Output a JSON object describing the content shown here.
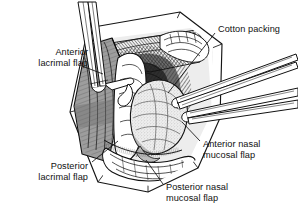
{
  "figure": {
    "type": "medical-line-illustration",
    "style": "black-and-white pen-and-ink hatching with gray tones",
    "background_color": "#ffffff",
    "ink_color": "#111111",
    "flap_gray": "#9a9a9a",
    "shadow_gray": "#4a4a4a",
    "packing_tone": "#e3e3e3"
  },
  "labels": [
    {
      "id": "anterior-lacrimal-flap",
      "lines": [
        "Anterior",
        "lacrimal flap"
      ],
      "align": "right",
      "leader_from": [
        82,
        66
      ],
      "leader_to": [
        103,
        74
      ]
    },
    {
      "id": "posterior-lacrimal-flap",
      "lines": [
        "Posterior",
        "lacrimal flap"
      ],
      "align": "right",
      "leader_from": [
        92,
        162
      ],
      "leader_to": [
        118,
        141
      ]
    },
    {
      "id": "cotton-packing",
      "lines": [
        "Cotton packing"
      ],
      "align": "left",
      "leader_from": [
        215,
        33
      ],
      "leader_to": [
        168,
        93
      ]
    },
    {
      "id": "anterior-nasal-mucosal-flap",
      "lines": [
        "Anterior nasal",
        "mucosal flap"
      ],
      "align": "left",
      "leader_from": [
        200,
        141
      ],
      "leader_to": [
        182,
        122
      ]
    },
    {
      "id": "posterior-nasal-mucosal-flap",
      "lines": [
        "Posterior nasal",
        "mucosal flap"
      ],
      "align": "left",
      "leader_from": [
        163,
        184
      ],
      "leader_to": [
        146,
        160
      ]
    }
  ],
  "instruments": [
    {
      "id": "forceps-upper-left",
      "entry": "top-left",
      "tips_at": [
        95,
        92
      ]
    },
    {
      "id": "forceps-right-upper",
      "entry": "right",
      "tips_at": [
        178,
        100
      ]
    },
    {
      "id": "forceps-right-lower",
      "entry": "right",
      "tips_at": [
        180,
        113
      ]
    }
  ]
}
